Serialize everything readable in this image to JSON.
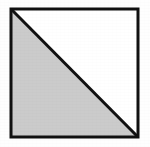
{
  "figure": {
    "title": "Square with diagonal, lower-left triangle shaded",
    "type": "geometric-diagram",
    "background_color": "#fefefe",
    "canvas": {
      "width": 150,
      "height": 147
    },
    "square": {
      "name": "outer-square",
      "left": 11,
      "top": 9,
      "right": 138,
      "bottom": 137,
      "side_px": 127,
      "stroke_color": "#111111",
      "stroke_width": 3,
      "fill_color": "#ffffff"
    },
    "diagonal": {
      "name": "diagonal-line",
      "from": "top-left",
      "to": "bottom-right",
      "x1": 11,
      "y1": 9,
      "x2": 138,
      "y2": 137,
      "stroke_color": "#111111",
      "stroke_width": 3
    },
    "regions": [
      {
        "name": "lower-left-triangle",
        "label": "",
        "shaded": true,
        "fill_color": "#cbcbcb",
        "vertices": "11,9 11,137 138,137"
      },
      {
        "name": "upper-right-triangle",
        "label": "",
        "shaded": false,
        "fill_color": "#ffffff",
        "vertices": "11,9 138,9 138,137"
      }
    ],
    "labels": []
  }
}
